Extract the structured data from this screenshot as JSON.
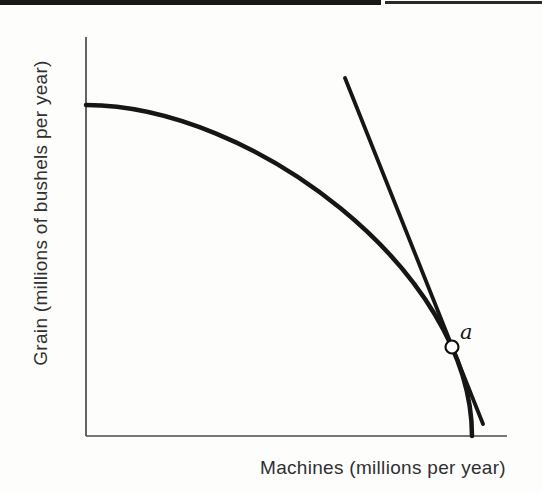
{
  "window": {
    "width": 542,
    "height": 492,
    "background": "#fdfdfc"
  },
  "header_rule": {
    "left_segment_color": "#191919",
    "right_segment_color": "#2a2a2a"
  },
  "chart_data": {
    "type": "line",
    "title": "",
    "xlabel": "Machines (millions per year)",
    "ylabel": "Grain (millions of bushels per year)",
    "grid": false,
    "legend": false,
    "x_axis": {
      "numeric_ticks": false,
      "tick_labels": []
    },
    "y_axis": {
      "numeric_ticks": false,
      "tick_labels": []
    },
    "series": [
      {
        "name": "production possibilities frontier",
        "style": "thick concave curve bowed outward from origin, starts horizontal at y-axis, ends vertical at x-axis",
        "points_frac_xy": [
          [
            0.0,
            0.83
          ],
          [
            0.308,
            0.758
          ],
          [
            0.604,
            0.571
          ],
          [
            0.751,
            0.419
          ],
          [
            0.869,
            0.223
          ],
          [
            0.917,
            0.0
          ]
        ]
      },
      {
        "name": "tangent line at point a",
        "style": "thick straight line crossing the frontier at point a",
        "points_frac_xy": [
          [
            0.615,
            0.897
          ],
          [
            0.943,
            0.03
          ]
        ]
      }
    ],
    "annotations": [
      {
        "label": "a",
        "marker": "open circle",
        "x_frac": 0.869,
        "y_frac": 0.223,
        "description": "tangency point of the straight line and the frontier"
      }
    ]
  },
  "figure_geometry": {
    "label_color": "#303030",
    "axis_color": "#4a4a4a",
    "axis_width": 1.7,
    "plot": {
      "origin_x": 86,
      "origin_y": 436,
      "y_axis_top": 37,
      "x_axis_right": 507
    },
    "curve": {
      "start": [
        86,
        105
      ],
      "c1": [
        250,
        105
      ],
      "c2": [
        472,
        270
      ],
      "end": [
        472,
        436
      ],
      "stroke": "#161616",
      "width": 4.5
    },
    "tangent": {
      "x1": 345,
      "y1": 78,
      "x2": 483,
      "y2": 424,
      "stroke": "#161616",
      "width": 3.8
    },
    "marker": {
      "cx": 452,
      "cy": 347,
      "r": 6.5,
      "fill": "#ffffff",
      "stroke": "#111111",
      "stroke_width": 2.2
    },
    "label_a": {
      "x": 460,
      "y": 339
    }
  }
}
